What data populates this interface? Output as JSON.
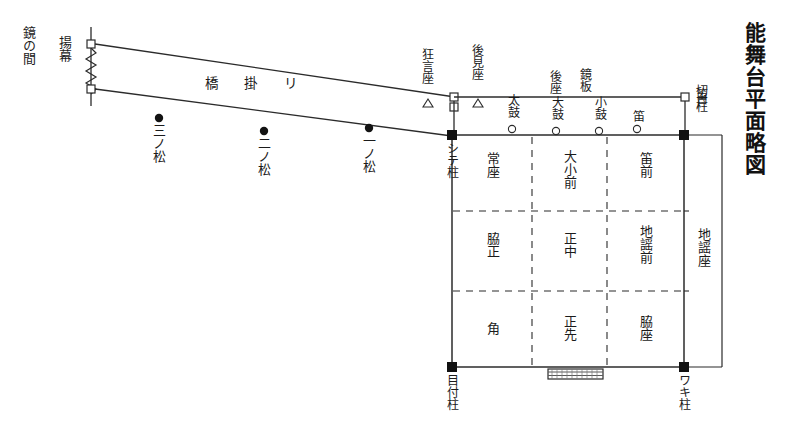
{
  "title": "能舞台平面略図",
  "bridge": {
    "mirror_room": "鏡の間",
    "curtain": "揚幕",
    "walkway": "橋 掛 リ",
    "pines": [
      {
        "name": "三ノ松"
      },
      {
        "name": "二ノ松"
      },
      {
        "name": "一ノ松"
      }
    ]
  },
  "pillars": {
    "shite": "シテ柱",
    "metsuke": "目付柱",
    "waki": "ワキ柱",
    "fue": "笛柱"
  },
  "seats": {
    "kyogen_za": "狂言座",
    "koken_za": "後見座",
    "kagami_ita": "鏡板",
    "ato_za": "後座",
    "kirido": "切戸",
    "jiutai_za": "地謡座"
  },
  "musicians": [
    {
      "name": "太鼓"
    },
    {
      "name": "大鼓"
    },
    {
      "name": "小鼓"
    },
    {
      "name": "笛"
    }
  ],
  "grid": {
    "rows": [
      [
        {
          "name": "常座"
        },
        {
          "name": "大小前"
        },
        {
          "name": "笛前"
        }
      ],
      [
        {
          "name": "脇正"
        },
        {
          "name": "正中"
        },
        {
          "name": "地謡前"
        }
      ],
      [
        {
          "name": "角"
        },
        {
          "name": "正先"
        },
        {
          "name": "脇座"
        }
      ]
    ]
  },
  "colors": {
    "line": "#2b2b2b",
    "fill": "#ffffff",
    "text": "#1b1b1b"
  }
}
